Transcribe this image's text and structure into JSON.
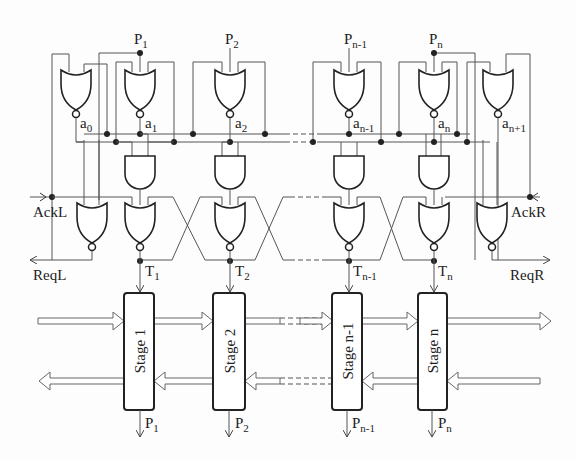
{
  "diagram": {
    "type": "asynchronous pipeline control circuit",
    "top_inputs": [
      {
        "label": "P",
        "sub": "1"
      },
      {
        "label": "P",
        "sub": "2"
      },
      {
        "label": "P",
        "sub": "n-1"
      },
      {
        "label": "P",
        "sub": "n"
      }
    ],
    "ack_nodes": [
      {
        "label": "a",
        "sub": "0"
      },
      {
        "label": "a",
        "sub": "1"
      },
      {
        "label": "a",
        "sub": "2"
      },
      {
        "label": "a",
        "sub": "n-1"
      },
      {
        "label": "a",
        "sub": "n"
      },
      {
        "label": "a",
        "sub": "n+1"
      }
    ],
    "left_signals": {
      "ack": "AckL",
      "req": "ReqL"
    },
    "right_signals": {
      "ack": "AckR",
      "req": "ReqR"
    },
    "triggers": [
      {
        "label": "T",
        "sub": "1"
      },
      {
        "label": "T",
        "sub": "2"
      },
      {
        "label": "T",
        "sub": "n-1"
      },
      {
        "label": "T",
        "sub": "n"
      }
    ],
    "stages": [
      {
        "label": "Stage 1"
      },
      {
        "label": "Stage 2"
      },
      {
        "label": "Stage n-1"
      },
      {
        "label": "Stage n"
      }
    ],
    "bottom_outputs": [
      {
        "label": "P",
        "sub": "1"
      },
      {
        "label": "P",
        "sub": "2"
      },
      {
        "label": "P",
        "sub": "n-1"
      },
      {
        "label": "P",
        "sub": "n"
      }
    ]
  }
}
